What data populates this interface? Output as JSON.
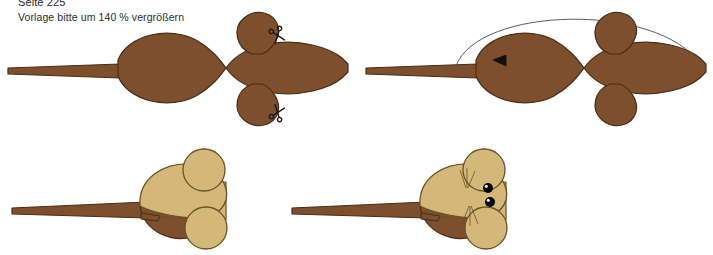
{
  "page": {
    "heading": "Seite 225",
    "instruction": "Vorlage bitte um 140 % vergrößern",
    "background_color": "#ffffff",
    "text_color": "#2b2b2b"
  },
  "palette": {
    "brown_fill": "#7d4f2c",
    "brown_outline": "#4a2d16",
    "tan_fill": "#d3b87a",
    "tan_outline": "#6b5226",
    "dark_brown_shadow": "#6a3f20",
    "eye_color": "#000000",
    "eye_highlight": "#ffffff",
    "fold_line_color": "#4a4a4a",
    "scissors_color": "#1a1a1a"
  },
  "figures": [
    {
      "id": "template-flat",
      "name": "Bastelvorlage flach",
      "description": "Ausgeschnittene braune Mausvorlage mit Schwanz, Körper, Kopf und zwei Ohren",
      "fill": "#7d4f2c",
      "outline": "#4a2d16",
      "markers": [
        {
          "type": "scissors",
          "name": "Schere oben",
          "x": 277,
          "y": 26,
          "rotation": -20
        },
        {
          "type": "scissors",
          "name": "Schere unten",
          "x": 277,
          "y": 106,
          "rotation": 200
        }
      ]
    },
    {
      "id": "template-folded",
      "name": "Vorlage mit Faltbogen",
      "description": "Gleiche Vorlage mit eingezeichnetem Faltbogen und Richtungspfeil",
      "fill": "#7d4f2c",
      "outline": "#4a2d16",
      "markers": [
        {
          "type": "fold-arc",
          "name": "Faltbogen",
          "from_x": 98,
          "to_x": 342,
          "peak_y": 4
        },
        {
          "type": "arrow-head",
          "name": "Richtungspfeil",
          "x": 142,
          "y": 52,
          "direction": "left"
        }
      ]
    },
    {
      "id": "model-plain",
      "name": "Fertige Maus ohne Gesicht",
      "description": "Zusammengefaltete Maus von der Seite, helle Oberseite, brauner Bauch",
      "body_fill": "#d3b87a",
      "belly_fill": "#7d4f2c",
      "outline": "#6b5226"
    },
    {
      "id": "model-face",
      "name": "Fertige Maus mit Gesicht",
      "description": "Zusammengefaltete Maus mit aufgemalten Augen und Schnurrhaaren",
      "body_fill": "#d3b87a",
      "belly_fill": "#7d4f2c",
      "outline": "#6b5226",
      "features": [
        {
          "type": "eye",
          "name": "Auge oben",
          "x": 208,
          "y": 48
        },
        {
          "type": "eye",
          "name": "Auge unten",
          "x": 210,
          "y": 62
        },
        {
          "type": "whiskers",
          "name": "Schnurrhaare oben",
          "x": 186,
          "y": 40
        },
        {
          "type": "whiskers",
          "name": "Schnurrhaare unten",
          "x": 188,
          "y": 72
        }
      ]
    }
  ]
}
